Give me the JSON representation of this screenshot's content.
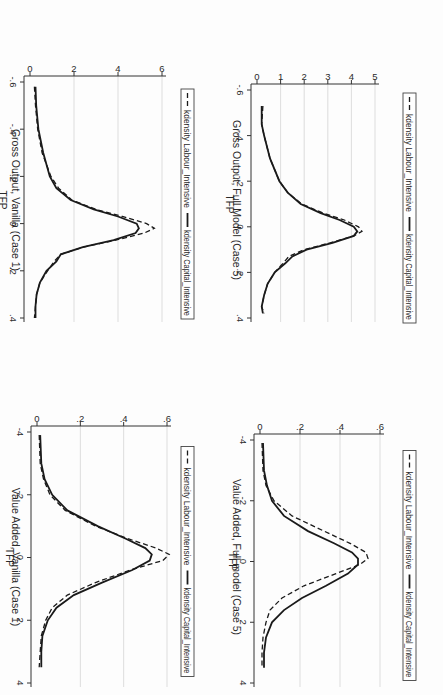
{
  "page": {
    "orientation": "rotated 90 degrees clockwise (scanned page)",
    "layout": "2x2 panel grid"
  },
  "legend": {
    "dashed_label": "kdensity Labour_Intensive",
    "solid_label": "kdensity Capital_Intensive"
  },
  "chart_data": [
    {
      "id": "go_vanilla",
      "type": "line",
      "title": "Gross Output, Vanilla (Case 1)",
      "xlabel": "TFP",
      "ylabel": "",
      "xlim": [
        -0.6,
        0.4
      ],
      "ylim": [
        0,
        6
      ],
      "xticks": [
        "-.6",
        "-.4",
        "-.2",
        "0",
        ".2",
        ".4"
      ],
      "xtick_values": [
        -0.6,
        -0.4,
        -0.2,
        0,
        0.2,
        0.4
      ],
      "yticks": [
        "0",
        "2",
        "4",
        "6"
      ],
      "ytick_values": [
        0,
        2,
        4,
        6
      ],
      "grid": true,
      "legend_position": "bottom",
      "series": [
        {
          "name": "kdensity Labour_Intensive",
          "style": "dashed",
          "x": [
            -0.58,
            -0.5,
            -0.4,
            -0.3,
            -0.2,
            -0.15,
            -0.1,
            -0.06,
            -0.03,
            0.0,
            0.02,
            0.04,
            0.07,
            0.1,
            0.13,
            0.16,
            0.2,
            0.25,
            0.3,
            0.35,
            0.4
          ],
          "y": [
            0.2,
            0.25,
            0.35,
            0.55,
            0.95,
            1.3,
            1.9,
            3.0,
            4.2,
            5.3,
            5.65,
            5.2,
            3.9,
            2.4,
            1.4,
            1.1,
            0.8,
            0.45,
            0.3,
            0.25,
            0.2
          ]
        },
        {
          "name": "kdensity Capital_Intensive",
          "style": "solid",
          "x": [
            -0.58,
            -0.5,
            -0.4,
            -0.3,
            -0.2,
            -0.15,
            -0.1,
            -0.06,
            -0.03,
            0.0,
            0.02,
            0.04,
            0.07,
            0.1,
            0.13,
            0.16,
            0.2,
            0.25,
            0.3,
            0.35,
            0.4
          ],
          "y": [
            0.25,
            0.28,
            0.38,
            0.6,
            0.9,
            1.2,
            1.85,
            2.9,
            4.0,
            4.85,
            4.95,
            4.8,
            3.8,
            2.4,
            1.4,
            1.2,
            0.75,
            0.45,
            0.3,
            0.25,
            0.25
          ]
        }
      ]
    },
    {
      "id": "va_vanilla",
      "type": "line",
      "title": "Value Added, Vanilla (Case 1)",
      "xlabel": "TFP",
      "ylabel": "",
      "xlim": [
        -4,
        4
      ],
      "ylim": [
        0,
        0.6
      ],
      "xticks": [
        "-4",
        "-2",
        "0",
        "2",
        "4"
      ],
      "xtick_values": [
        -4,
        -2,
        0,
        2,
        4
      ],
      "yticks": [
        "0",
        ".2",
        ".4",
        ".6"
      ],
      "ytick_values": [
        0,
        0.2,
        0.4,
        0.6
      ],
      "grid": true,
      "legend_position": "bottom",
      "series": [
        {
          "name": "kdensity Labour_Intensive",
          "style": "dashed",
          "x": [
            -3.9,
            -3.0,
            -2.5,
            -2.0,
            -1.5,
            -1.0,
            -0.6,
            -0.3,
            -0.1,
            0.1,
            0.4,
            0.8,
            1.2,
            1.6,
            2.0,
            2.5,
            3.0,
            3.5
          ],
          "y": [
            0.01,
            0.015,
            0.03,
            0.06,
            0.13,
            0.27,
            0.42,
            0.55,
            0.61,
            0.58,
            0.43,
            0.27,
            0.14,
            0.07,
            0.04,
            0.02,
            0.015,
            0.01
          ]
        },
        {
          "name": "kdensity Capital_Intensive",
          "style": "solid",
          "x": [
            -3.9,
            -3.0,
            -2.5,
            -2.0,
            -1.5,
            -1.0,
            -0.6,
            -0.3,
            -0.1,
            0.1,
            0.4,
            0.8,
            1.2,
            1.6,
            2.0,
            2.5,
            3.0,
            3.5
          ],
          "y": [
            0.015,
            0.02,
            0.035,
            0.07,
            0.14,
            0.28,
            0.41,
            0.5,
            0.53,
            0.52,
            0.44,
            0.3,
            0.17,
            0.09,
            0.05,
            0.025,
            0.02,
            0.02
          ]
        }
      ]
    },
    {
      "id": "go_full",
      "type": "line",
      "title": "Gross Output, Full Model (Case 5)",
      "xlabel": "TFP",
      "ylabel": "",
      "xlim": [
        -0.6,
        0.4
      ],
      "ylim": [
        0,
        5
      ],
      "xticks": [
        "-.6",
        "-.4",
        "-.2",
        "0",
        ".2",
        ".4"
      ],
      "xtick_values": [
        -0.6,
        -0.4,
        -0.2,
        0,
        0.2,
        0.4
      ],
      "yticks": [
        "0",
        "1",
        "2",
        "3",
        "4",
        "5"
      ],
      "ytick_values": [
        0,
        1,
        2,
        3,
        4,
        5
      ],
      "grid": true,
      "legend_position": "bottom",
      "series": [
        {
          "name": "kdensity Labour_Intensive",
          "style": "dashed",
          "x": [
            -0.53,
            -0.45,
            -0.4,
            -0.3,
            -0.2,
            -0.15,
            -0.1,
            -0.06,
            -0.03,
            0.0,
            0.02,
            0.04,
            0.07,
            0.1,
            0.13,
            0.16,
            0.2,
            0.25,
            0.3,
            0.35,
            0.38
          ],
          "y": [
            0.25,
            0.2,
            0.3,
            0.55,
            0.95,
            1.3,
            1.9,
            2.8,
            3.7,
            4.3,
            4.45,
            4.1,
            3.1,
            2.0,
            1.35,
            1.1,
            0.75,
            0.45,
            0.3,
            0.2,
            0.3
          ]
        },
        {
          "name": "kdensity Capital_Intensive",
          "style": "solid",
          "x": [
            -0.53,
            -0.45,
            -0.4,
            -0.3,
            -0.2,
            -0.15,
            -0.1,
            -0.06,
            -0.03,
            0.0,
            0.02,
            0.04,
            0.07,
            0.1,
            0.13,
            0.16,
            0.2,
            0.25,
            0.3,
            0.35,
            0.38
          ],
          "y": [
            0.2,
            0.2,
            0.3,
            0.55,
            0.95,
            1.3,
            1.85,
            2.7,
            3.5,
            4.1,
            4.25,
            4.1,
            3.2,
            2.1,
            1.5,
            1.2,
            0.75,
            0.45,
            0.3,
            0.2,
            0.25
          ]
        }
      ]
    },
    {
      "id": "va_full",
      "type": "line",
      "title": "Value Added, Full model (Case 5)",
      "xlabel": "TFP",
      "ylabel": "",
      "xlim": [
        -4,
        4
      ],
      "ylim": [
        0,
        0.6
      ],
      "xticks": [
        "-4",
        "-2",
        "0",
        "2",
        "4"
      ],
      "xtick_values": [
        -4,
        -2,
        0,
        2,
        4
      ],
      "yticks": [
        "0",
        ".2",
        ".4",
        ".6"
      ],
      "ytick_values": [
        0,
        0.2,
        0.4,
        0.6
      ],
      "grid": true,
      "legend_position": "bottom",
      "series": [
        {
          "name": "kdensity Labour_Intensive",
          "style": "dashed",
          "x": [
            -3.9,
            -3.0,
            -2.5,
            -2.0,
            -1.5,
            -1.0,
            -0.6,
            -0.3,
            -0.1,
            0.1,
            0.4,
            0.8,
            1.2,
            1.6,
            2.0,
            2.5,
            3.0,
            3.5
          ],
          "y": [
            0.01,
            0.015,
            0.03,
            0.07,
            0.16,
            0.32,
            0.45,
            0.53,
            0.54,
            0.5,
            0.38,
            0.22,
            0.11,
            0.05,
            0.03,
            0.015,
            0.01,
            0.01
          ]
        },
        {
          "name": "kdensity Capital_Intensive",
          "style": "solid",
          "x": [
            -3.9,
            -3.0,
            -2.5,
            -2.0,
            -1.5,
            -1.0,
            -0.6,
            -0.3,
            -0.1,
            0.1,
            0.4,
            0.8,
            1.2,
            1.6,
            2.0,
            2.5,
            3.0,
            3.5
          ],
          "y": [
            0.015,
            0.02,
            0.035,
            0.06,
            0.12,
            0.24,
            0.37,
            0.46,
            0.49,
            0.49,
            0.44,
            0.33,
            0.21,
            0.12,
            0.06,
            0.03,
            0.02,
            0.02
          ]
        }
      ]
    }
  ]
}
